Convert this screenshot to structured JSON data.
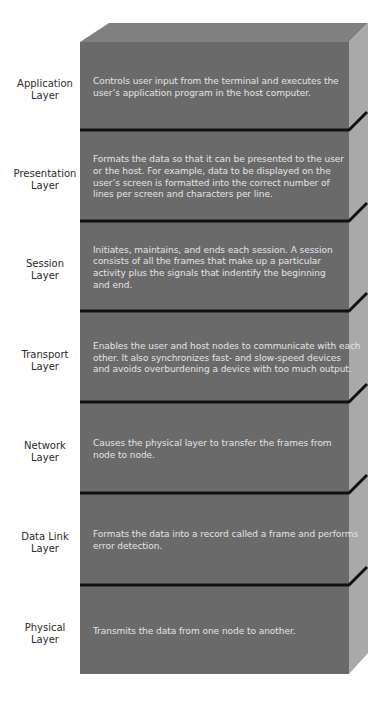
{
  "diagram": {
    "colors": {
      "front_face": "#6a6a6a",
      "top_face": "#808080",
      "side_face": "#a9a9a9",
      "separator": "#111111",
      "description_text": "#e4e4e4",
      "label_text": "#2a2a2a"
    }
  },
  "layers": [
    {
      "id": "application",
      "label": [
        "Application",
        "Layer"
      ],
      "description": [
        "Controls user input from the terminal and executes the",
        "user’s application program in the host computer."
      ]
    },
    {
      "id": "presentation",
      "label": [
        "Presentation",
        "Layer"
      ],
      "description": [
        "Formats the data so that it can be presented to the user",
        "or the host. For example, data to be displayed on the",
        "user’s screen is formatted into the correct number of",
        "lines per screen and characters per line."
      ]
    },
    {
      "id": "session",
      "label": [
        "Session",
        "Layer"
      ],
      "description": [
        "Initiates, maintains, and ends each session. A session",
        "consists of all the frames that make up a particular",
        "activity plus the signals that indentify the beginning",
        "and end."
      ]
    },
    {
      "id": "transport",
      "label": [
        "Transport",
        "Layer"
      ],
      "description": [
        "Enables the user and host nodes to communicate with each",
        "other. It also synchronizes fast- and slow-speed devices",
        "and avoids overburdening a device with too much output."
      ]
    },
    {
      "id": "network",
      "label": [
        "Network",
        "Layer"
      ],
      "description": [
        "Causes the physical layer to transfer the frames from",
        "node to node."
      ]
    },
    {
      "id": "data-link",
      "label": [
        "Data Link",
        "Layer"
      ],
      "description": [
        "Formats the data into a record called a frame and performs",
        "error detection."
      ]
    },
    {
      "id": "physical",
      "label": [
        "Physical",
        "Layer"
      ],
      "description": [
        "Transmits the data from one node to another."
      ]
    }
  ]
}
